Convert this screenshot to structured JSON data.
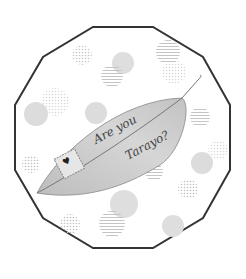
{
  "illustration": {
    "line1": "Are you",
    "line2": "Tarayo?",
    "frame_color": "#333333",
    "leaf_color": "#c8c8c8",
    "dot_color": "#d4d4d4"
  }
}
